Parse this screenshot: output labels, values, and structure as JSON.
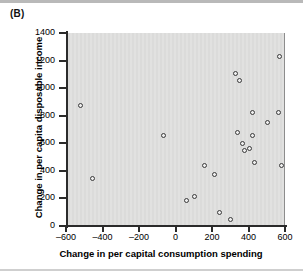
{
  "figure": {
    "panel_label": "(B)",
    "background_color": "#dededd",
    "axis_color": "#2b2b2b",
    "marker_color": "#3a3a3a"
  },
  "chart_data": {
    "type": "scatter",
    "title": "",
    "panel": "(B)",
    "xlabel": "Change in per capital consumption spending",
    "ylabel": "Change in per capita disposable income",
    "xlim": [
      -600,
      600
    ],
    "ylim": [
      0,
      1400
    ],
    "xticks": [
      -600,
      -400,
      -200,
      0,
      200,
      400,
      600
    ],
    "xtick_labels": [
      "–600",
      "–400",
      "–200",
      "0",
      "200",
      "400",
      "600"
    ],
    "yticks": [
      0,
      200,
      400,
      600,
      800,
      1000,
      1200,
      1400
    ],
    "ytick_labels": [
      "0",
      "200",
      "400",
      "600",
      "800",
      "1000",
      "1200",
      "1400"
    ],
    "grid": false,
    "legend": null,
    "marker": "open-circle",
    "points": [
      {
        "x": -523,
        "y": 875
      },
      {
        "x": -457,
        "y": 345
      },
      {
        "x": -67,
        "y": 655
      },
      {
        "x": 62,
        "y": 185
      },
      {
        "x": 103,
        "y": 215
      },
      {
        "x": 157,
        "y": 437
      },
      {
        "x": 213,
        "y": 372
      },
      {
        "x": 243,
        "y": 97
      },
      {
        "x": 300,
        "y": 48
      },
      {
        "x": 330,
        "y": 1108
      },
      {
        "x": 352,
        "y": 1057
      },
      {
        "x": 337,
        "y": 678
      },
      {
        "x": 366,
        "y": 602
      },
      {
        "x": 376,
        "y": 545
      },
      {
        "x": 404,
        "y": 563
      },
      {
        "x": 420,
        "y": 823
      },
      {
        "x": 424,
        "y": 655
      },
      {
        "x": 432,
        "y": 460
      },
      {
        "x": 505,
        "y": 752
      },
      {
        "x": 563,
        "y": 820
      },
      {
        "x": 570,
        "y": 1228
      },
      {
        "x": 580,
        "y": 440
      }
    ]
  }
}
